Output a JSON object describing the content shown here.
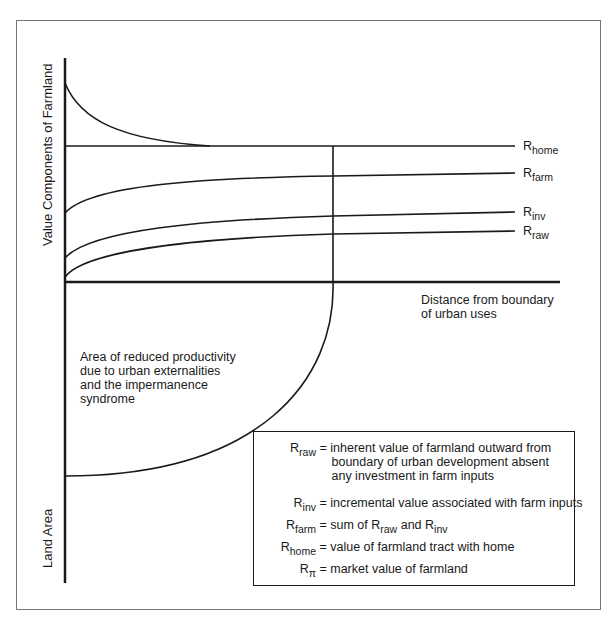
{
  "axes": {
    "y_upper_label": "Value Components of Farmland",
    "y_lower_label": "Land Area",
    "x_label_line1": "Distance from boundary",
    "x_label_line2": "of urban uses"
  },
  "curves": [
    {
      "base": "R",
      "sub": "home"
    },
    {
      "base": "R",
      "sub": "farm"
    },
    {
      "base": "R",
      "sub": "inv"
    },
    {
      "base": "R",
      "sub": "raw"
    }
  ],
  "area_note": {
    "lines": [
      "Area of reduced productivity",
      "due to urban externalities",
      "and the impermanence",
      "syndrome"
    ]
  },
  "legend": {
    "items": [
      {
        "base": "R",
        "sub": "raw",
        "lines": [
          "= inherent value of farmland outward from",
          "boundary of urban development absent",
          "any investment in farm inputs"
        ]
      },
      {
        "base": "R",
        "sub": "inv",
        "lines": [
          "= incremental value associated with farm inputs"
        ]
      },
      {
        "base": "R",
        "sub": "farm",
        "pre": "= sum of ",
        "a_base": "R",
        "a_sub": "raw",
        "mid": " and ",
        "b_base": "R",
        "b_sub": "inv"
      },
      {
        "base": "R",
        "sub": "home",
        "lines": [
          "= value of farmland tract with home"
        ]
      },
      {
        "base": "R",
        "sub": "π",
        "lines": [
          "= market value of farmland"
        ]
      }
    ]
  },
  "colors": {
    "line": "#1a1a1a",
    "frame": "#666666",
    "background": "#ffffff"
  }
}
